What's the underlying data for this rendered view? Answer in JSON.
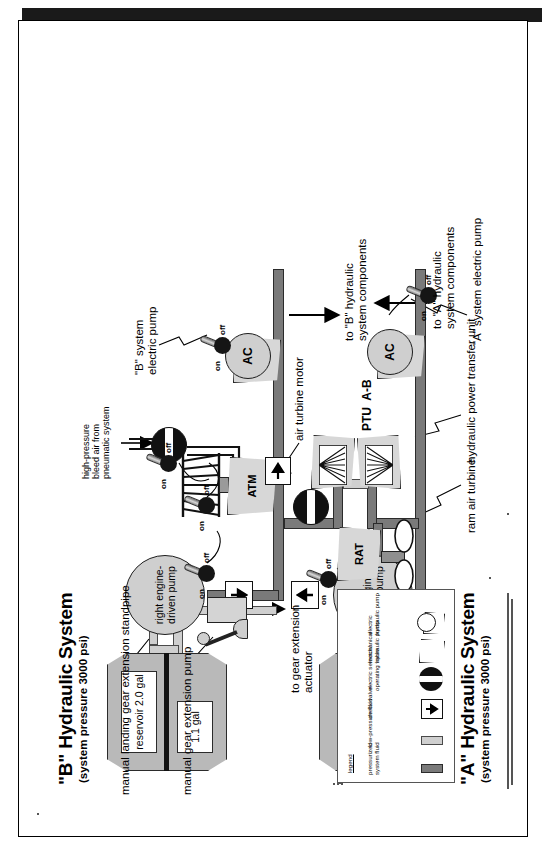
{
  "document": {
    "kind": "aircraft-hydraulic-system-schematic",
    "orientation": "rotated-90-counterclockwise"
  },
  "systems": {
    "b": {
      "title": "\"B\" Hydraulic System",
      "subtitle": "(system pressure 3000 psi)",
      "reservoir_label": "reservoir\n2.0 gal",
      "standpipe_label": "1.1\ngal",
      "engine_pump_label": "right\nengine-\ndriven\npump",
      "electric_pump_label": "\"B\" system\nelectric pump",
      "electric_pump_symbol": "AC",
      "output_label": "to \"B\" hydraulic\nsystem components",
      "standpipe_callout": "manual landing gear extension standpipe",
      "manual_pump_callout": "manual gear extension pump",
      "actuator_callout": "to gear extension\nactuator"
    },
    "a": {
      "title": "\"A\" Hydraulic System",
      "subtitle": "(system pressure 3000 psi)",
      "reservoir_label": "reservoir\n2.0 gal",
      "engine_pump_label": "left\nengine-\ndriven\npump",
      "electric_pump_label": "\"A\" system electric pump",
      "electric_pump_symbol": "AC",
      "output_label": "to \"A\" hydraulic\nsystem components"
    }
  },
  "components": {
    "atm": {
      "symbol": "ATM",
      "callout": "air turbine motor",
      "bleed_air_label": "high-pressure\nbleed air from\npneumatic system"
    },
    "rat": {
      "symbol": "RAT",
      "callout": "ram air turbine"
    },
    "ptu": {
      "symbol": "PTU  A-B",
      "callout": "hydraulic power transfer unit"
    }
  },
  "switches": [
    {
      "id": "sw-manual-1",
      "on": "on",
      "off": "off"
    },
    {
      "id": "sw-manual-2",
      "on": "on",
      "off": "off"
    },
    {
      "id": "sw-atm",
      "on": "on",
      "off": "off"
    },
    {
      "id": "sw-rat",
      "on": "on",
      "off": "off"
    },
    {
      "id": "sw-b-electric",
      "on": "on",
      "off": "off"
    },
    {
      "id": "sw-a-electric",
      "on": "on",
      "off": "off"
    }
  ],
  "legend": {
    "title": "legend",
    "items": [
      {
        "symbol": "high-pressure-bar",
        "label": "pressurized\nsystem fluid"
      },
      {
        "symbol": "low-pressure-bar",
        "label": "low-pressure fluid"
      },
      {
        "symbol": "check-valve",
        "label": "check valve"
      },
      {
        "symbol": "selector-valve",
        "label": "electric selector/\noperating valve"
      },
      {
        "symbol": "mechanical-pump",
        "label": "mechanical\nhydraulic pump"
      },
      {
        "symbol": "electric-pump",
        "label": "electric\nhydraulic pump"
      }
    ]
  },
  "colors": {
    "pressurized": "#7a7a7a",
    "low_pressure": "#cfcfcf",
    "reservoir": "#b9b9b9",
    "component": "#d7d7d7",
    "outline": "#1d1d1d"
  }
}
